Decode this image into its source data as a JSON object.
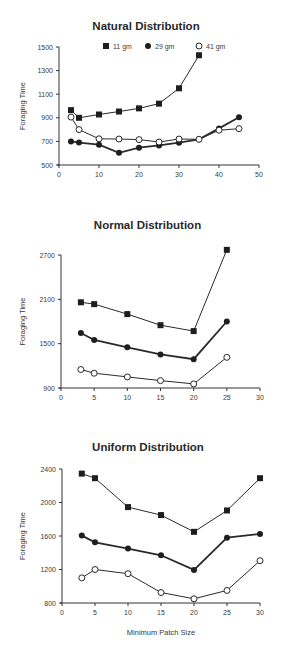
{
  "figure": {
    "legend": [
      {
        "label": "11 gm",
        "marker": "filled-square"
      },
      {
        "label": "29 gm",
        "marker": "filled-circle"
      },
      {
        "label": "41 gm",
        "marker": "open-circle"
      }
    ],
    "shared_xlabel": "Minimum Patch Size"
  },
  "chart_data": [
    {
      "type": "line",
      "title": "Natural Distribution",
      "xlabel": "",
      "ylabel": "Foraging Time",
      "xlim": [
        0,
        50
      ],
      "ylim": [
        500,
        1500
      ],
      "xticks": [
        0,
        10,
        20,
        30,
        40,
        50
      ],
      "yticks": [
        500,
        700,
        900,
        1100,
        1300,
        1500
      ],
      "grid": false,
      "legend_position": "top",
      "series": [
        {
          "name": "11 gm",
          "marker": "filled-square",
          "x": [
            3,
            5,
            10,
            15,
            20,
            25,
            30,
            35
          ],
          "values": [
            965,
            900,
            928,
            953,
            980,
            1020,
            1150,
            1430
          ]
        },
        {
          "name": "29 gm",
          "marker": "filled-circle",
          "x": [
            3,
            5,
            10,
            15,
            20,
            25,
            30,
            35,
            40,
            45
          ],
          "values": [
            700,
            690,
            672,
            603,
            647,
            666,
            689,
            718,
            810,
            905
          ]
        },
        {
          "name": "41 gm",
          "marker": "open-circle",
          "x": [
            3,
            5,
            10,
            15,
            20,
            25,
            30,
            35,
            40,
            45
          ],
          "values": [
            906,
            800,
            722,
            720,
            715,
            695,
            720,
            718,
            795,
            808
          ]
        }
      ]
    },
    {
      "type": "line",
      "title": "Normal Distribution",
      "xlabel": "",
      "ylabel": "Foraging Time",
      "xlim": [
        0,
        30
      ],
      "ylim": [
        900,
        2700
      ],
      "xticks": [
        0,
        5,
        10,
        15,
        20,
        25,
        30
      ],
      "yticks": [
        900,
        1500,
        2100,
        2700
      ],
      "grid": false,
      "series": [
        {
          "name": "11 gm",
          "marker": "filled-square",
          "x": [
            3,
            5,
            10,
            15,
            20,
            25
          ],
          "values": [
            2060,
            2035,
            1900,
            1750,
            1670,
            2770
          ]
        },
        {
          "name": "29 gm",
          "marker": "filled-circle",
          "x": [
            3,
            5,
            10,
            15,
            20,
            25
          ],
          "values": [
            1645,
            1550,
            1450,
            1355,
            1290,
            1800
          ]
        },
        {
          "name": "41 gm",
          "marker": "open-circle",
          "x": [
            3,
            5,
            10,
            15,
            20,
            25
          ],
          "values": [
            1150,
            1100,
            1050,
            1000,
            955,
            1315
          ]
        }
      ]
    },
    {
      "type": "line",
      "title": "Uniform Distribution",
      "xlabel": "Minimum Patch Size",
      "ylabel": "Foraging Time",
      "xlim": [
        0,
        30
      ],
      "ylim": [
        800,
        2400
      ],
      "xticks": [
        0,
        5,
        10,
        15,
        20,
        25,
        30
      ],
      "yticks": [
        800,
        1200,
        1600,
        2000,
        2400
      ],
      "grid": false,
      "series": [
        {
          "name": "11 gm",
          "marker": "filled-square",
          "x": [
            3,
            5,
            10,
            15,
            20,
            25,
            30
          ],
          "values": [
            2345,
            2290,
            1945,
            1850,
            1650,
            1905,
            2290
          ]
        },
        {
          "name": "29 gm",
          "marker": "filled-circle",
          "x": [
            3,
            5,
            10,
            15,
            20,
            25,
            30
          ],
          "values": [
            1605,
            1525,
            1450,
            1370,
            1195,
            1580,
            1625
          ]
        },
        {
          "name": "41 gm",
          "marker": "open-circle",
          "x": [
            3,
            5,
            10,
            15,
            20,
            25,
            30
          ],
          "values": [
            1100,
            1200,
            1150,
            925,
            850,
            950,
            1305
          ]
        }
      ]
    }
  ]
}
